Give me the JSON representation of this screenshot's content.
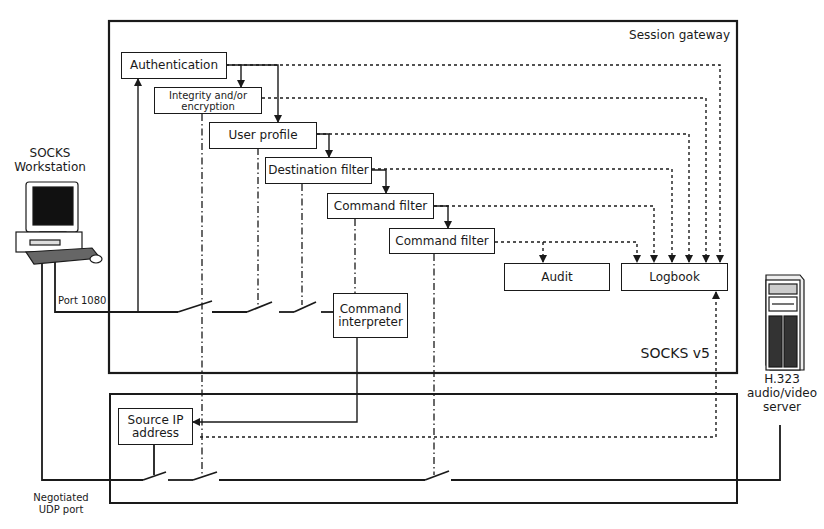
{
  "diagram": {
    "containers": {
      "session_gateway": "Session gateway",
      "socks_version": "SOCKS v5"
    },
    "modules": {
      "authentication": "Authentication",
      "integrity_line1": "Integrity and/or",
      "integrity_line2": "encryption",
      "user_profile": "User profile",
      "destination_filter": "Destination filter",
      "command_filter_1": "Command filter",
      "command_filter_2": "Command filter",
      "audit": "Audit",
      "logbook": "Logbook",
      "command_interpreter_line1": "Command",
      "command_interpreter_line2": "interpreter",
      "source_ip_line1": "Source IP",
      "source_ip_line2": "address"
    },
    "endpoints": {
      "workstation_line1": "SOCKS",
      "workstation_line2": "Workstation",
      "server_line1": "H.323",
      "server_line2": "audio/video",
      "server_line3": "server"
    },
    "ports": {
      "tcp_port": "Port 1080",
      "udp_line1": "Negotiated",
      "udp_line2": "UDP port"
    },
    "colors": {
      "line": "#1a1a1a",
      "background": "#ffffff"
    }
  }
}
